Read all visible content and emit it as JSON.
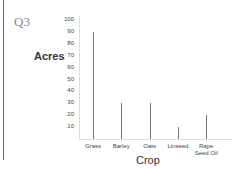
{
  "question_label": "Q3",
  "chart_data": {
    "type": "bar",
    "title": "",
    "xlabel": "Crop",
    "ylabel": "Acres",
    "ylim": [
      0,
      100
    ],
    "yticks": [
      10,
      20,
      30,
      40,
      50,
      60,
      70,
      80,
      90,
      100
    ],
    "categories": [
      "Grass",
      "Barley",
      "Oats",
      "Linseed",
      "Rape Seed Oil"
    ],
    "values": [
      90,
      30,
      30,
      10,
      20
    ],
    "grid": false,
    "legend": null
  }
}
